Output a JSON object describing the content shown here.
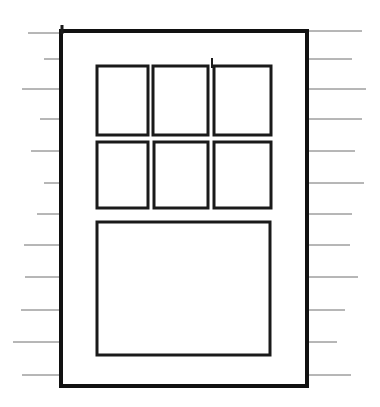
{
  "drawing": {
    "title": "Window elevation line drawing",
    "description": "Black-and-white line sketch of a six-over-one window with horizontal wall siding lines at left and right.",
    "canvas": {
      "width": 380,
      "height": 407,
      "background": "#ffffff"
    },
    "colors": {
      "ink": "#111111",
      "pane_stroke": "#1a1a1a",
      "siding_stroke": "#6f6f6f",
      "fill": "#ffffff"
    },
    "frame": {
      "label": "window-frame",
      "x": 61,
      "y": 31,
      "width": 246,
      "height": 355,
      "stroke_width": 4
    },
    "panes": [
      {
        "label": "upper-left-pane",
        "x": 97,
        "y": 66,
        "width": 51,
        "height": 69
      },
      {
        "label": "upper-center-pane",
        "x": 153,
        "y": 66,
        "width": 55,
        "height": 69
      },
      {
        "label": "upper-right-pane",
        "x": 214,
        "y": 66,
        "width": 57,
        "height": 69
      },
      {
        "label": "middle-left-pane",
        "x": 97,
        "y": 142,
        "width": 51,
        "height": 66
      },
      {
        "label": "middle-center-pane",
        "x": 154,
        "y": 142,
        "width": 54,
        "height": 66
      },
      {
        "label": "middle-right-pane",
        "x": 214,
        "y": 142,
        "width": 57,
        "height": 66
      }
    ],
    "large_pane": {
      "label": "lower-large-pane",
      "x": 97,
      "y": 222,
      "width": 173,
      "height": 133
    },
    "mullion_tick": {
      "label": "mullion-tick",
      "x": 212,
      "y1": 58,
      "y2": 68
    },
    "corner_tick": {
      "label": "frame-corner-tick",
      "x": 62,
      "y1": 25,
      "y2": 34
    },
    "siding_left": {
      "label": "left-wall-siding",
      "end_x": 62,
      "lines": [
        {
          "y": 33,
          "start_x": 28
        },
        {
          "y": 59,
          "start_x": 44
        },
        {
          "y": 89,
          "start_x": 22
        },
        {
          "y": 119,
          "start_x": 40
        },
        {
          "y": 151,
          "start_x": 31
        },
        {
          "y": 183,
          "start_x": 44
        },
        {
          "y": 214,
          "start_x": 37
        },
        {
          "y": 245,
          "start_x": 24
        },
        {
          "y": 277,
          "start_x": 25
        },
        {
          "y": 310,
          "start_x": 21
        },
        {
          "y": 342,
          "start_x": 13
        },
        {
          "y": 375,
          "start_x": 22
        }
      ]
    },
    "siding_right": {
      "label": "right-wall-siding",
      "start_x": 306,
      "lines": [
        {
          "y": 31,
          "end_x": 362
        },
        {
          "y": 59,
          "end_x": 352
        },
        {
          "y": 89,
          "end_x": 366
        },
        {
          "y": 119,
          "end_x": 362
        },
        {
          "y": 151,
          "end_x": 355
        },
        {
          "y": 183,
          "end_x": 364
        },
        {
          "y": 214,
          "end_x": 352
        },
        {
          "y": 245,
          "end_x": 350
        },
        {
          "y": 277,
          "end_x": 358
        },
        {
          "y": 310,
          "end_x": 345
        },
        {
          "y": 342,
          "end_x": 337
        },
        {
          "y": 375,
          "end_x": 351
        }
      ]
    }
  }
}
